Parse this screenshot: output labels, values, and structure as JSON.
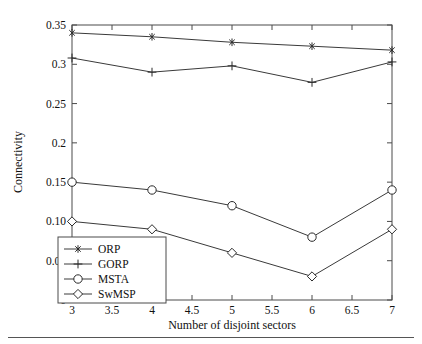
{
  "chart_data": {
    "type": "line",
    "title": "",
    "xlabel": "Number of disjoint sectors",
    "ylabel": "Connectivity",
    "x": [
      3,
      4,
      5,
      6,
      7
    ],
    "xlim": [
      3,
      7
    ],
    "ylim": [
      0,
      0.35
    ],
    "xticks": [
      3,
      3.5,
      4,
      4.5,
      5,
      5.5,
      6,
      6.5,
      7
    ],
    "xtick_labels": [
      "3",
      "3.5",
      "4",
      "4.5",
      "5",
      "5.5",
      "6",
      "6.5",
      "7"
    ],
    "yticks": [
      0,
      0.05,
      0.1,
      0.15,
      0.2,
      0.25,
      0.3,
      0.35
    ],
    "ytick_labels": [
      "0",
      "0.05",
      "0.10",
      "0.15",
      "0.2",
      "0.25",
      "0.3",
      "0.35"
    ],
    "grid": false,
    "legend_position": "lower left",
    "series": [
      {
        "name": "ORP",
        "marker": "asterisk",
        "values": [
          0.34,
          0.335,
          0.328,
          0.323,
          0.318
        ]
      },
      {
        "name": "GORP",
        "marker": "plus",
        "values": [
          0.308,
          0.29,
          0.298,
          0.277,
          0.303
        ]
      },
      {
        "name": "MSTA",
        "marker": "circle",
        "values": [
          0.15,
          0.14,
          0.12,
          0.08,
          0.14
        ]
      },
      {
        "name": "SwMSP",
        "marker": "diamond",
        "values": [
          0.1,
          0.09,
          0.06,
          0.03,
          0.09
        ]
      }
    ]
  },
  "legend": {
    "entries": [
      "ORP",
      "GORP",
      "MSTA",
      "SwMSP"
    ]
  },
  "colors": {
    "line": "#3a3a3a",
    "axis": "#4a4a4a",
    "text": "#111111",
    "background": "#ffffff"
  }
}
